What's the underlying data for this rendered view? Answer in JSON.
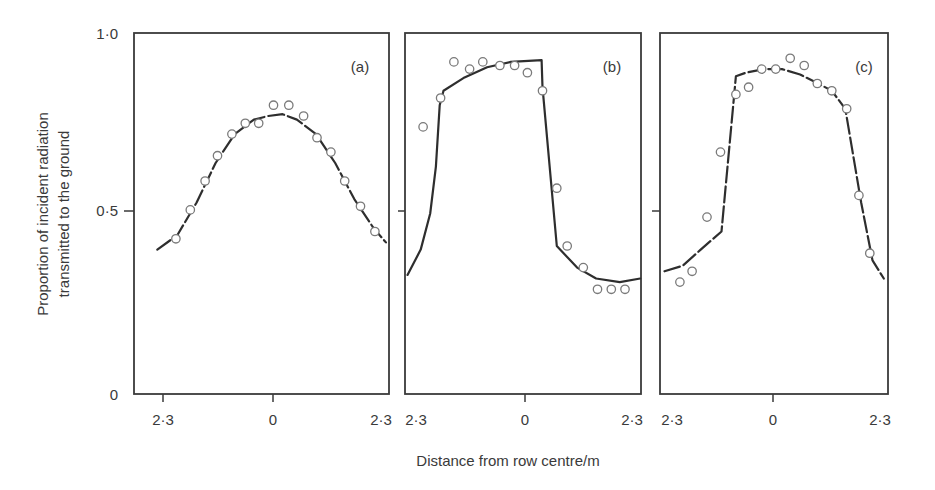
{
  "chart_data": [
    {
      "type": "scatter",
      "panel_label": "(a)",
      "xlabel": "Distance from row centre/m",
      "ylabel": "Proportion of incident radiation transmitted to the ground",
      "xlim": [
        -2.3,
        2.3
      ],
      "ylim": [
        0,
        1.0
      ],
      "x_ticks": [
        "2·3",
        "0",
        "2·3"
      ],
      "y_ticks": [
        "0",
        "0·5",
        "1·0"
      ],
      "points": [
        {
          "x": -2.03,
          "y": 0.43
        },
        {
          "x": -1.73,
          "y": 0.51
        },
        {
          "x": -1.42,
          "y": 0.59
        },
        {
          "x": -1.16,
          "y": 0.66
        },
        {
          "x": -0.86,
          "y": 0.72
        },
        {
          "x": -0.58,
          "y": 0.75
        },
        {
          "x": -0.3,
          "y": 0.75
        },
        {
          "x": 0.01,
          "y": 0.8
        },
        {
          "x": 0.33,
          "y": 0.8
        },
        {
          "x": 0.64,
          "y": 0.77
        },
        {
          "x": 0.92,
          "y": 0.71
        },
        {
          "x": 1.21,
          "y": 0.67
        },
        {
          "x": 1.5,
          "y": 0.59
        },
        {
          "x": 1.83,
          "y": 0.52
        },
        {
          "x": 2.13,
          "y": 0.45
        }
      ],
      "curve": [
        {
          "x": -2.42,
          "y": 0.4
        },
        {
          "x": -2.0,
          "y": 0.44
        },
        {
          "x": -1.6,
          "y": 0.53
        },
        {
          "x": -1.2,
          "y": 0.64
        },
        {
          "x": -0.8,
          "y": 0.72
        },
        {
          "x": -0.4,
          "y": 0.76
        },
        {
          "x": -0.1,
          "y": 0.77
        },
        {
          "x": 0.2,
          "y": 0.775
        },
        {
          "x": 0.5,
          "y": 0.76
        },
        {
          "x": 0.9,
          "y": 0.72
        },
        {
          "x": 1.3,
          "y": 0.64
        },
        {
          "x": 1.7,
          "y": 0.54
        },
        {
          "x": 2.1,
          "y": 0.46
        },
        {
          "x": 2.36,
          "y": 0.42
        }
      ],
      "curve_style": "dashed"
    },
    {
      "type": "scatter",
      "panel_label": "(b)",
      "xlim": [
        -2.3,
        2.3
      ],
      "ylim": [
        0,
        1.0
      ],
      "x_ticks": [
        "2·3",
        "0",
        "2·3"
      ],
      "points": [
        {
          "x": -2.15,
          "y": 0.74
        },
        {
          "x": -1.78,
          "y": 0.82
        },
        {
          "x": -1.5,
          "y": 0.92
        },
        {
          "x": -1.17,
          "y": 0.9
        },
        {
          "x": -0.89,
          "y": 0.92
        },
        {
          "x": -0.53,
          "y": 0.91
        },
        {
          "x": -0.22,
          "y": 0.91
        },
        {
          "x": 0.05,
          "y": 0.89
        },
        {
          "x": 0.37,
          "y": 0.84
        },
        {
          "x": 0.67,
          "y": 0.57
        },
        {
          "x": 0.89,
          "y": 0.41
        },
        {
          "x": 1.23,
          "y": 0.35
        },
        {
          "x": 1.53,
          "y": 0.29
        },
        {
          "x": 1.82,
          "y": 0.29
        },
        {
          "x": 2.11,
          "y": 0.29
        }
      ],
      "curve": [
        {
          "x": -2.48,
          "y": 0.33
        },
        {
          "x": -2.2,
          "y": 0.4
        },
        {
          "x": -2.0,
          "y": 0.5
        },
        {
          "x": -1.88,
          "y": 0.63
        },
        {
          "x": -1.8,
          "y": 0.8
        },
        {
          "x": -1.72,
          "y": 0.84
        },
        {
          "x": -1.3,
          "y": 0.875
        },
        {
          "x": -0.8,
          "y": 0.905
        },
        {
          "x": -0.3,
          "y": 0.92
        },
        {
          "x": 0.35,
          "y": 0.925
        },
        {
          "x": 0.37,
          "y": 0.85
        },
        {
          "x": 0.67,
          "y": 0.41
        },
        {
          "x": 1.1,
          "y": 0.35
        },
        {
          "x": 1.5,
          "y": 0.32
        },
        {
          "x": 2.0,
          "y": 0.31
        },
        {
          "x": 2.43,
          "y": 0.32
        }
      ],
      "curve_style": "solid"
    },
    {
      "type": "scatter",
      "panel_label": "(c)",
      "xlim": [
        -2.3,
        2.3
      ],
      "ylim": [
        0,
        1.0
      ],
      "x_ticks": [
        "2·3",
        "0",
        "2·3"
      ],
      "points": [
        {
          "x": -2.06,
          "y": 0.31
        },
        {
          "x": -1.79,
          "y": 0.34
        },
        {
          "x": -1.46,
          "y": 0.49
        },
        {
          "x": -1.16,
          "y": 0.67
        },
        {
          "x": -0.82,
          "y": 0.83
        },
        {
          "x": -0.54,
          "y": 0.85
        },
        {
          "x": -0.25,
          "y": 0.9
        },
        {
          "x": 0.06,
          "y": 0.9
        },
        {
          "x": 0.38,
          "y": 0.93
        },
        {
          "x": 0.69,
          "y": 0.91
        },
        {
          "x": 0.98,
          "y": 0.86
        },
        {
          "x": 1.3,
          "y": 0.84
        },
        {
          "x": 1.63,
          "y": 0.79
        },
        {
          "x": 1.9,
          "y": 0.55
        },
        {
          "x": 2.14,
          "y": 0.39
        }
      ],
      "curve": [
        {
          "x": -2.4,
          "y": 0.34
        },
        {
          "x": -2.0,
          "y": 0.355
        },
        {
          "x": -1.6,
          "y": 0.4
        },
        {
          "x": -1.14,
          "y": 0.45
        },
        {
          "x": -0.82,
          "y": 0.88
        },
        {
          "x": -0.6,
          "y": 0.89
        },
        {
          "x": -0.2,
          "y": 0.9
        },
        {
          "x": 0.2,
          "y": 0.9
        },
        {
          "x": 0.6,
          "y": 0.885
        },
        {
          "x": 1.0,
          "y": 0.86
        },
        {
          "x": 1.3,
          "y": 0.84
        },
        {
          "x": 1.6,
          "y": 0.79
        },
        {
          "x": 1.95,
          "y": 0.53
        },
        {
          "x": 2.2,
          "y": 0.37
        },
        {
          "x": 2.45,
          "y": 0.32
        }
      ],
      "curve_style": "dashed-solid"
    }
  ],
  "axes": {
    "y_title_line1": "Proportion of incident radiation",
    "y_title_line2": "transmitted to the ground",
    "x_title": "Distance from row centre/m",
    "y_tick_labels": [
      "1·0",
      "0·5",
      "0"
    ]
  },
  "panels": {
    "a": {
      "label": "(a)",
      "tick_left": "2·3",
      "tick_mid": "0",
      "tick_right": "2·3"
    },
    "b": {
      "label": "(b)",
      "tick_left": "2·3",
      "tick_mid": "0",
      "tick_right": "2·3"
    },
    "c": {
      "label": "(c)",
      "tick_left": "2·3",
      "tick_mid": "0",
      "tick_right": "2·3"
    }
  }
}
